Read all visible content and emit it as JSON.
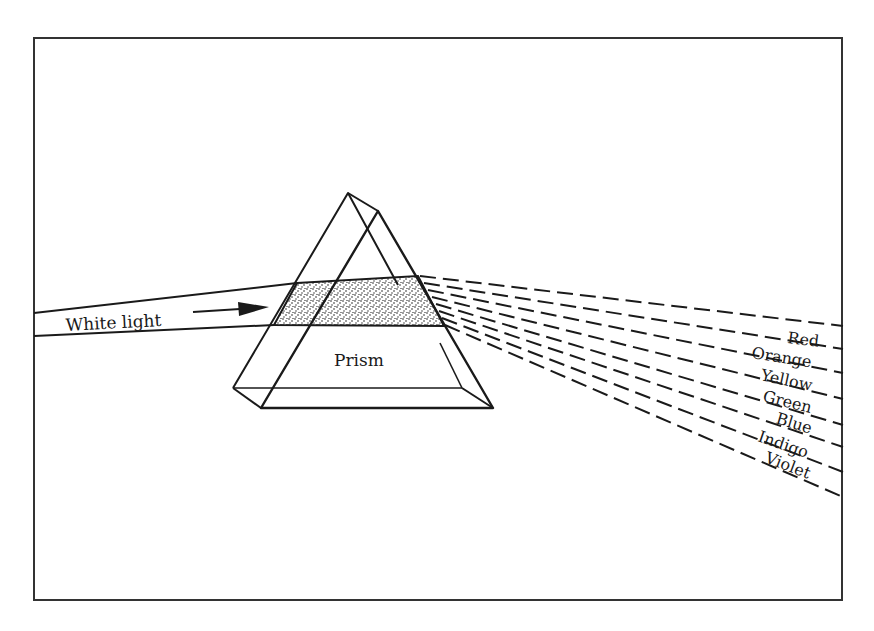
{
  "diagram": {
    "type": "prism-dispersion",
    "labels": {
      "incoming": "White light",
      "prism": "Prism"
    },
    "spectrum": [
      "Red",
      "Orange",
      "Yellow",
      "Green",
      "Blue",
      "Indigo",
      "Violet"
    ],
    "colors": {
      "stroke": "#1a1a1a",
      "background": "#ffffff"
    }
  }
}
